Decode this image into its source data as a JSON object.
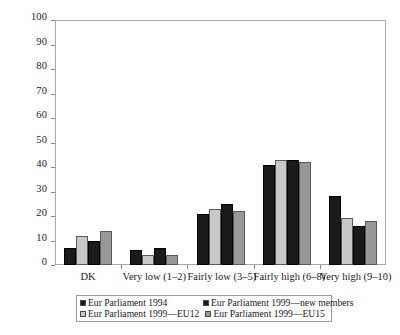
{
  "chart_data": {
    "type": "bar",
    "title": "",
    "subtitle": "",
    "xlabel": "",
    "ylabel": "",
    "ylim": [
      0,
      100
    ],
    "ytick_step": 10,
    "yticks": [
      0,
      10,
      20,
      30,
      40,
      50,
      60,
      70,
      80,
      90,
      100
    ],
    "ytick_labels": [
      "0",
      "10",
      "20",
      "30",
      "40",
      "50",
      "60",
      "70",
      "80",
      "90",
      "100"
    ],
    "grid": false,
    "legend_position": "bottom",
    "categories": [
      "DK",
      "Very low (1–2)",
      "Fairly low (3–5)",
      "Fairly high (6–8)",
      "Very high (9–10)"
    ],
    "series": [
      {
        "name": "Eur Parliament 1994",
        "color": "#1a1a1a",
        "values": [
          7,
          6,
          21,
          41,
          28
        ]
      },
      {
        "name": "Eur Parliament 1999—new members",
        "color": "#c8c8c8",
        "values": [
          12,
          4,
          23,
          43,
          19
        ]
      },
      {
        "name": "Eur Parliament 1999—EU12",
        "color": "#1a1a1a",
        "values": [
          10,
          7,
          25,
          43,
          16
        ]
      },
      {
        "name": "Eur Parliament 1999—EU15",
        "color": "#989898",
        "values": [
          14,
          4,
          22,
          42,
          18
        ]
      }
    ]
  },
  "legend": {
    "entries": [
      {
        "label": "Eur Parliament 1994",
        "color": "#1a1a1a"
      },
      {
        "label": "Eur Parliament 1999—new members",
        "color": "#1a1a1a"
      },
      {
        "label": "Eur Parliament 1999—EU12",
        "color": "#c8c8c8"
      },
      {
        "label": "Eur Parliament 1999—EU15",
        "color": "#989898"
      }
    ]
  },
  "colors": {
    "series_1": "#1a1a1a",
    "series_2": "#c8c8c8",
    "series_3": "#1a1a1a",
    "series_4": "#989898",
    "axis": "#a8a8a8",
    "text": "#1a1a1a",
    "background": "#ffffff"
  }
}
